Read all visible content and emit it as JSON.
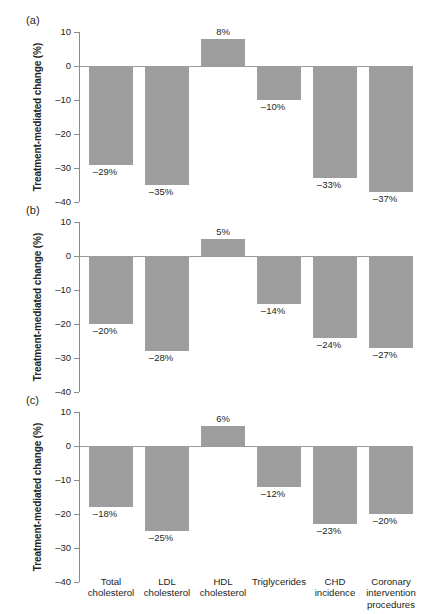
{
  "figure": {
    "ylabel": "Treatment-mediated change (%)",
    "yticks": [
      10,
      0,
      -10,
      -20,
      -30,
      -40
    ],
    "ytick_labels": [
      "10",
      "0",
      "–10",
      "–20",
      "–30",
      "–40"
    ],
    "categories": [
      "Total\ncholesterol",
      "LDL\ncholesterol",
      "HDL\ncholesterol",
      "Triglycerides",
      "CHD\nincidence",
      "Coronary\nintervention\nprocedures"
    ],
    "category_lines": [
      [
        "Total",
        "cholesterol"
      ],
      [
        "LDL",
        "cholesterol"
      ],
      [
        "HDL",
        "cholesterol"
      ],
      [
        "Triglycerides"
      ],
      [
        "CHD",
        "incidence"
      ],
      [
        "Coronary",
        "intervention",
        "procedures"
      ]
    ],
    "panel_labels": [
      "(a)",
      "(b)",
      "(c)"
    ],
    "bar_color": "#9d9d9d",
    "axis_color": "#8c8c8c",
    "text_color": "#231f20"
  },
  "chart_data": [
    {
      "type": "bar",
      "panel": "(a)",
      "title": "",
      "xlabel": "",
      "ylabel": "Treatment-mediated change (%)",
      "ylim": [
        -40,
        10
      ],
      "grid": false,
      "legend": "none",
      "categories": [
        "Total cholesterol",
        "LDL cholesterol",
        "HDL cholesterol",
        "Triglycerides",
        "CHD incidence",
        "Coronary intervention procedures"
      ],
      "values": [
        -29,
        -35,
        8,
        -10,
        -33,
        -37
      ],
      "value_labels": [
        "–29%",
        "–35%",
        "8%",
        "–10%",
        "–33%",
        "–37%"
      ]
    },
    {
      "type": "bar",
      "panel": "(b)",
      "title": "",
      "xlabel": "",
      "ylabel": "Treatment-mediated change (%)",
      "ylim": [
        -40,
        10
      ],
      "grid": false,
      "legend": "none",
      "categories": [
        "Total cholesterol",
        "LDL cholesterol",
        "HDL cholesterol",
        "Triglycerides",
        "CHD incidence",
        "Coronary intervention procedures"
      ],
      "values": [
        -20,
        -28,
        5,
        -14,
        -24,
        -27
      ],
      "value_labels": [
        "–20%",
        "–28%",
        "5%",
        "–14%",
        "–24%",
        "–27%"
      ]
    },
    {
      "type": "bar",
      "panel": "(c)",
      "title": "",
      "xlabel": "",
      "ylabel": "Treatment-mediated change (%)",
      "ylim": [
        -40,
        10
      ],
      "grid": false,
      "legend": "none",
      "categories": [
        "Total cholesterol",
        "LDL cholesterol",
        "HDL cholesterol",
        "Triglycerides",
        "CHD incidence",
        "Coronary intervention procedures"
      ],
      "values": [
        -18,
        -25,
        6,
        -12,
        -23,
        -20
      ],
      "value_labels": [
        "–18%",
        "–25%",
        "6%",
        "–12%",
        "–23%",
        "–20%"
      ]
    }
  ]
}
